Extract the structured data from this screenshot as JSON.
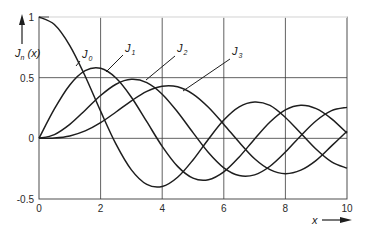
{
  "chart_data": {
    "type": "line",
    "title": "",
    "xlabel": "x",
    "ylabel": "J_n(x)",
    "xlim": [
      0,
      10
    ],
    "ylim": [
      -0.5,
      1
    ],
    "grid": true,
    "legend_position": "inline labels with leader lines",
    "x_ticks": [
      "0",
      "2",
      "4",
      "6",
      "8",
      "10"
    ],
    "y_ticks": [
      "1",
      "0.5",
      "0",
      "-0.5"
    ],
    "x": [
      0,
      0.5,
      1,
      1.5,
      2,
      2.5,
      3,
      3.5,
      4,
      4.5,
      5,
      5.5,
      6,
      6.5,
      7,
      7.5,
      8,
      8.5,
      9,
      9.5,
      10
    ],
    "series": [
      {
        "name": "J0",
        "label_main": "J",
        "label_sub": "0",
        "values": [
          1,
          0.938,
          0.765,
          0.512,
          0.224,
          -0.048,
          -0.26,
          -0.38,
          -0.397,
          -0.321,
          -0.178,
          -0.007,
          0.151,
          0.26,
          0.3,
          0.271,
          0.172,
          0.042,
          -0.09,
          -0.194,
          -0.246
        ]
      },
      {
        "name": "J1",
        "label_main": "J",
        "label_sub": "1",
        "values": [
          0,
          0.242,
          0.44,
          0.558,
          0.577,
          0.497,
          0.339,
          0.137,
          -0.066,
          -0.231,
          -0.328,
          -0.341,
          -0.277,
          -0.154,
          -0.005,
          0.135,
          0.235,
          0.273,
          0.245,
          0.161,
          0.043
        ]
      },
      {
        "name": "J2",
        "label_main": "J",
        "label_sub": "2",
        "values": [
          0,
          0.031,
          0.115,
          0.232,
          0.353,
          0.446,
          0.486,
          0.459,
          0.364,
          0.217,
          0.047,
          -0.117,
          -0.243,
          -0.307,
          -0.301,
          -0.23,
          -0.113,
          0.022,
          0.145,
          0.228,
          0.255
        ]
      },
      {
        "name": "J3",
        "label_main": "J",
        "label_sub": "3",
        "values": [
          0,
          0.003,
          0.02,
          0.061,
          0.129,
          0.217,
          0.309,
          0.387,
          0.43,
          0.425,
          0.365,
          0.256,
          0.115,
          -0.032,
          -0.168,
          -0.258,
          -0.291,
          -0.262,
          -0.181,
          -0.062,
          0.058
        ]
      }
    ],
    "annotations": [
      {
        "series": "J0",
        "text_x": 82,
        "text_y": 58,
        "line": [
          80,
          61,
          76,
          66
        ]
      },
      {
        "series": "J1",
        "text_x": 125,
        "text_y": 52,
        "line": [
          123,
          55,
          106,
          72
        ]
      },
      {
        "series": "J2",
        "text_x": 177,
        "text_y": 52,
        "line": [
          175,
          56,
          146,
          80
        ]
      },
      {
        "series": "J3",
        "text_x": 232,
        "text_y": 55,
        "line": [
          230,
          59,
          183,
          91
        ]
      }
    ],
    "colors": {
      "curve": "#1e1e1e",
      "grid": "#3a3a3a",
      "text": "#2a2a2a"
    }
  },
  "axis_labels": {
    "y_main": "J",
    "y_sub": "n",
    "y_rest": " (x)",
    "x": "x"
  }
}
